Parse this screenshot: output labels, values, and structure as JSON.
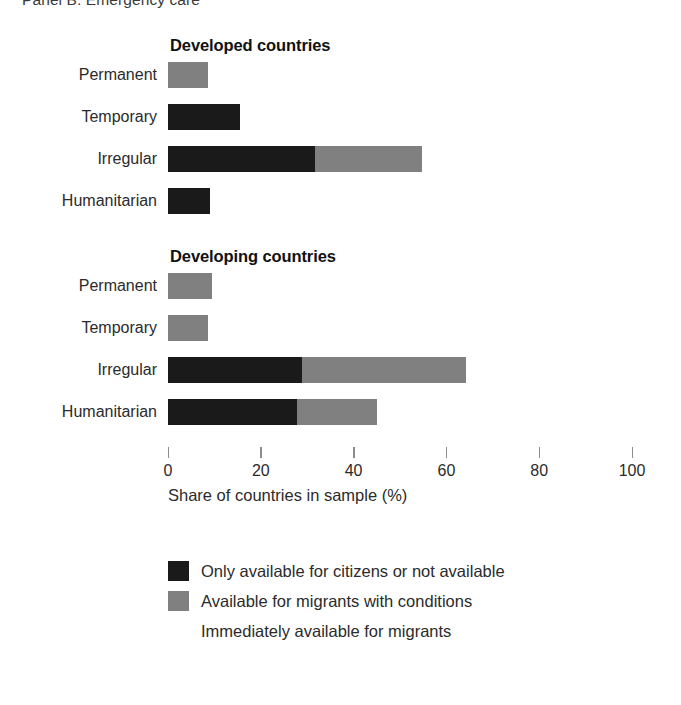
{
  "panel": {
    "title": "Panel B. Emergency care"
  },
  "axis": {
    "title": "Share of countries in sample (%)",
    "ticks": [
      "0",
      "20",
      "40",
      "60",
      "80",
      "100"
    ]
  },
  "legend": {
    "items": [
      {
        "label": "Only available for citizens or not available",
        "color": "#1a1a1a"
      },
      {
        "label": "Available for migrants with conditions",
        "color": "#808080"
      },
      {
        "label": "Immediately available for migrants",
        "color": "#ffffff"
      }
    ]
  },
  "chart_data": {
    "type": "bar",
    "orientation": "horizontal",
    "stacked": true,
    "title": "Panel B. Emergency care",
    "xlabel": "Share of countries in sample (%)",
    "ylabel": "",
    "xlim": [
      0,
      100
    ],
    "xticks": [
      0,
      20,
      40,
      60,
      80,
      100
    ],
    "grid": false,
    "legend_position": "bottom",
    "categories": [
      "Permanent",
      "Temporary",
      "Irregular",
      "Humanitarian"
    ],
    "series": [
      {
        "name": "Only available for citizens or not available",
        "color": "#1a1a1a"
      },
      {
        "name": "Available for migrants with conditions",
        "color": "#808080"
      },
      {
        "name": "Immediately available for migrants",
        "color": "#ffffff"
      }
    ],
    "groups": [
      {
        "name": "Developed countries",
        "bars": [
          {
            "category": "Permanent",
            "values": [
              0.0,
              8.6,
              91.4
            ]
          },
          {
            "category": "Temporary",
            "values": [
              15.6,
              0.0,
              84.4
            ]
          },
          {
            "category": "Irregular",
            "values": [
              31.6,
              23.2,
              45.2
            ]
          },
          {
            "category": "Humanitarian",
            "values": [
              9.0,
              0.0,
              91.0
            ]
          }
        ]
      },
      {
        "name": "Developing countries",
        "bars": [
          {
            "category": "Permanent",
            "values": [
              0.0,
              9.5,
              90.5
            ]
          },
          {
            "category": "Temporary",
            "values": [
              0.0,
              8.6,
              91.4
            ]
          },
          {
            "category": "Irregular",
            "values": [
              28.8,
              35.5,
              35.7
            ]
          },
          {
            "category": "Humanitarian",
            "values": [
              27.7,
              17.4,
              54.9
            ]
          }
        ]
      }
    ]
  }
}
